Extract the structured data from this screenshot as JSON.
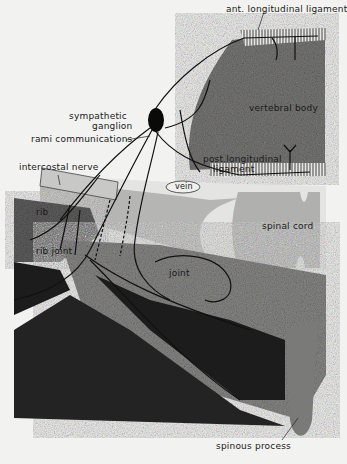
{
  "figure": {
    "type": "anatomical-diagram",
    "colors": {
      "background": "#f2f2f0",
      "bone_dark": "#1c1c1c",
      "bone_mid": "#8a8a88",
      "vertebral_body": "#7a7a78",
      "spinal_cord": "#b5b5b3",
      "nerve": "#111111",
      "ligament_hatch": "#555555"
    }
  },
  "labels": {
    "ant_longitudinal_ligament": "ant. longitudinal ligament",
    "vertebral_body": "vertebral body",
    "sympathetic": "sympathetic",
    "ganglion": "ganglion",
    "rami_communications": "rami communications",
    "post_longitudinal": "post.longitudinal",
    "ligament": "ligament",
    "intercostal_nerve": "intercostal nerve",
    "vein": "vein",
    "spinal_cord": "spinal cord",
    "rib": "rib",
    "rib_joint": "rib joint",
    "joint": "joint",
    "spinous_process": "spinous process"
  }
}
